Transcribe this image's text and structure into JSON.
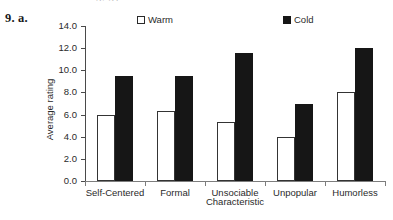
{
  "item_number": "9. a.",
  "page_bleed_text": "gy g p",
  "legend": {
    "warm_label": "Warm",
    "cold_label": "Cold",
    "warm_color": "#ffffff",
    "cold_color": "#161616"
  },
  "chart_data": {
    "type": "bar",
    "title": "",
    "xlabel": "Characteristic",
    "ylabel": "Average rating",
    "categories": [
      "Self-Centered",
      "Formal",
      "Unsociable",
      "Unpopular",
      "Humorless"
    ],
    "series": [
      {
        "name": "Warm",
        "values": [
          6.0,
          6.3,
          5.3,
          4.0,
          8.0
        ],
        "color": "#ffffff"
      },
      {
        "name": "Cold",
        "values": [
          9.5,
          9.5,
          11.6,
          7.0,
          12.0
        ],
        "color": "#161616"
      }
    ],
    "ylim": [
      0.0,
      14.0
    ],
    "ytick_values": [
      0.0,
      2.0,
      4.0,
      6.0,
      8.0,
      10.0,
      12.0,
      14.0
    ],
    "ytick_labels": [
      "0.0",
      "2.0",
      "4.0",
      "6.0",
      "8.0",
      "10.0",
      "12.0",
      "14.0"
    ],
    "grid": false,
    "legend_position": "top"
  }
}
